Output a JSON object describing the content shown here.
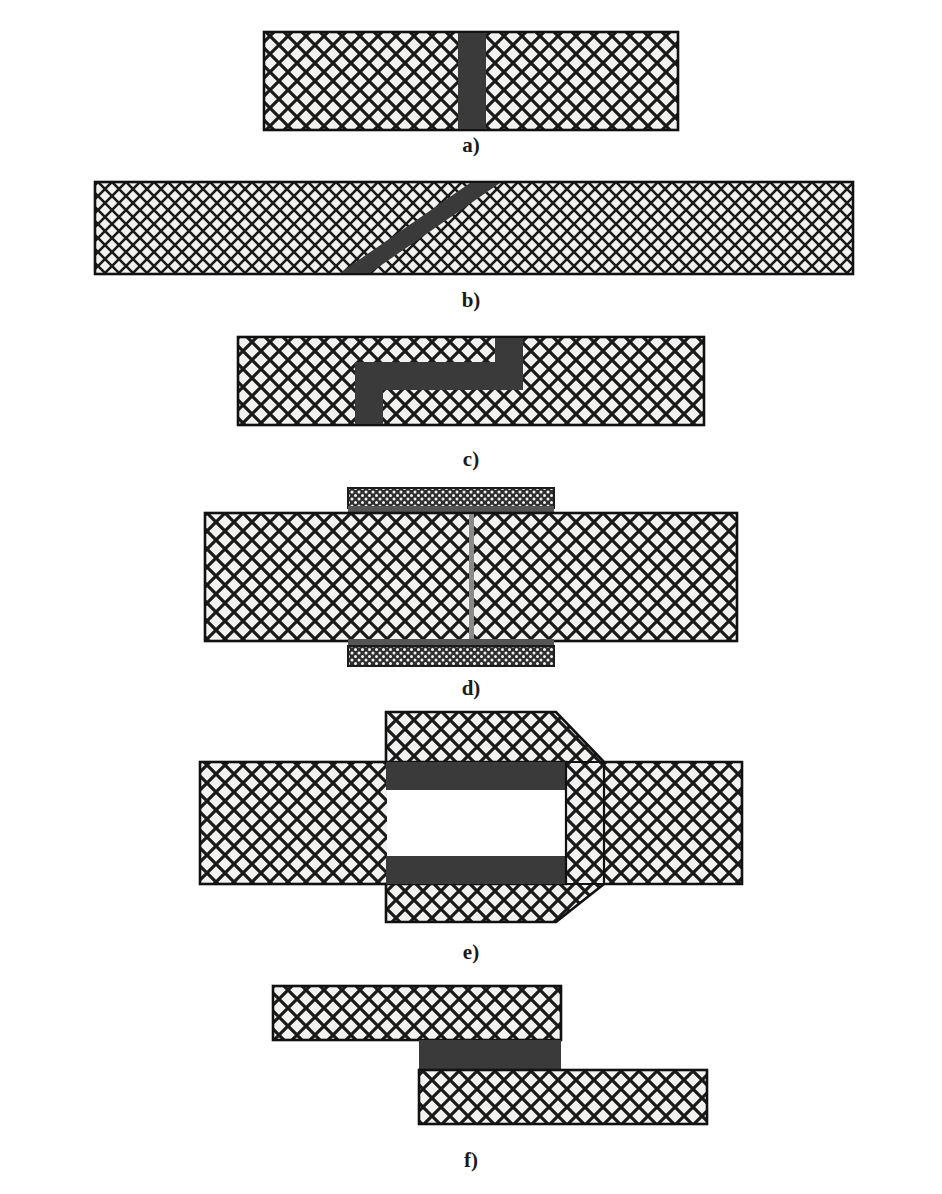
{
  "document": {
    "title": "Adhesive bonded joint configurations",
    "top_caption": "",
    "background_color": "#ffffff"
  },
  "style": {
    "adherend_fill": "#f2f2f0",
    "adherend_hatch_line": "#1a1a1a",
    "adherend_outline": "#111111",
    "adhesive_dark": "#3a3a3a",
    "adhesive_gray": "#7d7d7d",
    "cover_plate_fill": "#333333",
    "cover_plate_dot": "#ffffff",
    "label_color": "#1a1a1a"
  },
  "panels": [
    {
      "id": "a",
      "label": "a)",
      "name": "butt-joint",
      "label_x": 471,
      "label_y": 133,
      "geometry": {
        "bar_x": 264,
        "bar_y": 32,
        "bar_width": 414,
        "bar_height": 98,
        "weld_x": 458,
        "weld_width": 28
      }
    },
    {
      "id": "b",
      "label": "b)",
      "name": "scarf-joint",
      "label_x": 471,
      "label_y": 288,
      "geometry": {
        "bar_x": 95,
        "bar_y": 182,
        "bar_width": 758,
        "bar_height": 92,
        "weld_top_x": 470,
        "weld_bottom_x": 340,
        "weld_width": 30
      }
    },
    {
      "id": "c",
      "label": "c)",
      "name": "stepped-lap-joint",
      "label_x": 471,
      "label_y": 447,
      "geometry": {
        "bar_x": 238,
        "bar_y": 337,
        "bar_width": 466,
        "bar_height": 88,
        "step_left_x": 355,
        "step_right_x": 523,
        "step_thickness": 28,
        "mid_y_top": 360,
        "mid_y_bottom": 390
      }
    },
    {
      "id": "d",
      "label": "d)",
      "name": "double-strap-joint",
      "label_x": 471,
      "label_y": 676,
      "geometry": {
        "bar_x": 205,
        "bar_y": 513,
        "bar_width": 532,
        "bar_height": 128,
        "strap_x": 348,
        "strap_width": 206,
        "strap_height": 22,
        "glue_height": 8,
        "seam_x": 469,
        "seam_width": 5
      }
    },
    {
      "id": "e",
      "label": "e)",
      "name": "socket-joint",
      "label_x": 471,
      "label_y": 940,
      "geometry": {
        "left_bar_x": 200,
        "left_bar_y": 762,
        "left_bar_width": 400,
        "left_bar_height": 122,
        "socket_x": 386,
        "socket_y": 712,
        "socket_width": 200,
        "socket_height": 210,
        "right_bar_y": 785,
        "right_bar_height": 76,
        "right_bar_end": 742,
        "adhesive_height": 22
      }
    },
    {
      "id": "f",
      "label": "f)",
      "name": "single-lap-joint",
      "label_x": 471,
      "label_y": 1152,
      "geometry": {
        "upper_bar_x": 273,
        "upper_bar_y": 986,
        "upper_bar_width": 288,
        "upper_bar_height": 54,
        "lower_bar_x": 419,
        "lower_bar_y": 1070,
        "lower_bar_width": 288,
        "lower_bar_height": 54,
        "adhesive_x": 419,
        "adhesive_y": 1040,
        "adhesive_width": 142,
        "adhesive_height": 30
      }
    }
  ]
}
